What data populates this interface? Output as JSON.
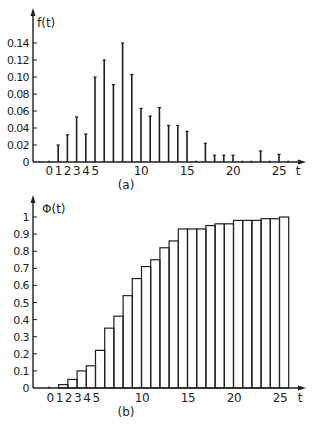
{
  "chart_data": [
    {
      "type": "bar",
      "panel_label": "(a)",
      "title": "",
      "xlabel": "t",
      "ylabel": "f(t)",
      "style": "stem",
      "xlim": [
        0,
        26
      ],
      "ylim": [
        0,
        0.14
      ],
      "y_ticks": [
        0,
        0.02,
        0.04,
        0.06,
        0.08,
        0.1,
        0.12,
        0.14
      ],
      "y_tick_labels": [
        "0",
        "0.02",
        "0.04",
        "0.06",
        "0.08",
        "0.10",
        "0.12",
        "0.14"
      ],
      "x_tick_labels": [
        {
          "t": 0,
          "label": "0"
        },
        {
          "t": 1,
          "label": "1"
        },
        {
          "t": 2,
          "label": "2"
        },
        {
          "t": 3,
          "label": "3"
        },
        {
          "t": 4,
          "label": "4"
        },
        {
          "t": 5,
          "label": "5"
        },
        {
          "t": 10,
          "label": "10"
        },
        {
          "t": 15,
          "label": "15"
        },
        {
          "t": 20,
          "label": "20"
        },
        {
          "t": 25,
          "label": "25"
        }
      ],
      "categories": [
        0,
        1,
        2,
        3,
        4,
        5,
        6,
        7,
        8,
        9,
        10,
        11,
        12,
        13,
        14,
        15,
        16,
        17,
        18,
        19,
        20,
        21,
        22,
        23,
        24,
        25,
        26
      ],
      "values": [
        0,
        0.02,
        0.032,
        0.053,
        0.033,
        0.1,
        0.12,
        0.091,
        0.14,
        0.103,
        0.063,
        0.054,
        0.064,
        0.043,
        0.043,
        0.036,
        0,
        0.022,
        0.008,
        0.008,
        0.008,
        0,
        0,
        0.013,
        0,
        0.009,
        0
      ],
      "grid": false,
      "legend": null
    },
    {
      "type": "bar",
      "panel_label": "(b)",
      "title": "",
      "xlabel": "t",
      "ylabel": "Φ(t)",
      "style": "step-histogram",
      "xlim": [
        0,
        26
      ],
      "ylim": [
        0,
        1
      ],
      "y_ticks": [
        0,
        0.1,
        0.2,
        0.3,
        0.4,
        0.5,
        0.6,
        0.7,
        0.8,
        0.9,
        1
      ],
      "y_tick_labels": [
        "0",
        "0.1",
        "0.2",
        "0.3",
        "0.4",
        "0.5",
        "0.6",
        "0.7",
        "0.8",
        "0.9",
        "1"
      ],
      "x_tick_labels": [
        {
          "t": 0,
          "label": "0"
        },
        {
          "t": 1,
          "label": "1"
        },
        {
          "t": 2,
          "label": "2"
        },
        {
          "t": 3,
          "label": "3"
        },
        {
          "t": 4,
          "label": "4"
        },
        {
          "t": 5,
          "label": "5"
        },
        {
          "t": 10,
          "label": "10"
        },
        {
          "t": 15,
          "label": "15"
        },
        {
          "t": 20,
          "label": "20"
        },
        {
          "t": 25,
          "label": "25"
        }
      ],
      "categories": [
        1,
        2,
        3,
        4,
        5,
        6,
        7,
        8,
        9,
        10,
        11,
        12,
        13,
        14,
        15,
        16,
        17,
        18,
        19,
        20,
        21,
        22,
        23,
        24,
        25
      ],
      "values": [
        0.02,
        0.05,
        0.1,
        0.13,
        0.22,
        0.35,
        0.42,
        0.54,
        0.64,
        0.71,
        0.75,
        0.82,
        0.86,
        0.93,
        0.93,
        0.93,
        0.95,
        0.96,
        0.96,
        0.98,
        0.98,
        0.98,
        0.99,
        0.99,
        1.0
      ],
      "grid": false,
      "legend": null
    }
  ],
  "colors": {
    "ink": "#1e1e1e",
    "paper": "#ffffff"
  }
}
